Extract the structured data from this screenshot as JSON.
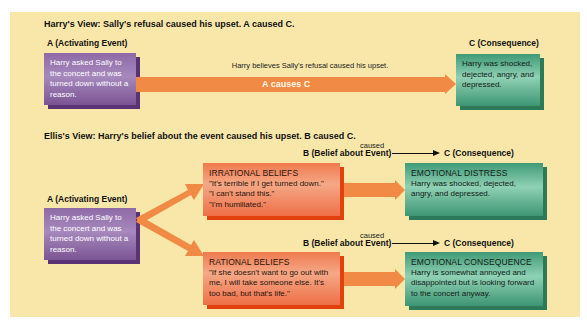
{
  "harry_view": {
    "heading": "Harry's View: Sally's refusal caused his upset. A caused C.",
    "a_label": "A (Activating Event)",
    "a_text": "Harry asked Sally to the concert and was turned down without a reason.",
    "arrow_caption": "Harry believes Sally's refusal caused his upset.",
    "arrow_label": "A causes C",
    "c_label": "C (Consequence)",
    "c_text": "Harry was shocked, dejected, angry, and depressed."
  },
  "ellis_view": {
    "heading": "Ellis's View: Harry's belief about the event caused his upset. B caused C.",
    "a_label": "A (Activating Event)",
    "a_text": "Harry asked Sally to the concert and was turned down without a reason.",
    "irrational": {
      "b_label": "B (Belief about Event)",
      "caused": "caused",
      "c_label": "C (Consequence)",
      "belief_title": "IRRATIONAL BELIEFS",
      "belief_lines": [
        "\"It's terrible if I get turned down.\"",
        "\"I can't stand this.\"",
        "\"I'm humiliated.\""
      ],
      "consequence_title": "EMOTIONAL DISTRESS",
      "consequence_text": "Harry was shocked, dejected, angry, and depressed."
    },
    "rational": {
      "b_label": "B (Belief about Event)",
      "caused": "caused",
      "c_label": "C (Consequence)",
      "belief_title": "RATIONAL BELIEFS",
      "belief_text": "\"If she doesn't want to go out with me, I will take someone else. It's too bad, but that's life.\"",
      "consequence_title": "EMOTIONAL CONSEQUENCE",
      "consequence_text": "Harry is somewhat annoyed and disappointed but is looking forward to the concert anyway."
    }
  },
  "colors": {
    "panel": "#f9e7aa",
    "arrow": "#f08a45",
    "activating_box": "#8e6aa6",
    "consequence_box": "#3f9a76",
    "belief_box": "#ef7a4e"
  }
}
